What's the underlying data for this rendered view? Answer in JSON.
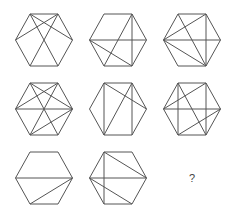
{
  "puzzle": {
    "stroke_color": "#555555",
    "grid": {
      "cols": 3,
      "rows": 3,
      "col_x": [
        44,
        118,
        192
      ],
      "row_y": [
        40,
        109,
        178
      ],
      "half_width": 28.5,
      "half_side": 14,
      "half_height": 26
    },
    "vertex_order": [
      "TL",
      "TR",
      "R",
      "BR",
      "BL",
      "L"
    ],
    "cells": [
      {
        "index": 1,
        "row": 0,
        "col": 0,
        "diagonals": [
          [
            "TL",
            "R"
          ],
          [
            "TR",
            "L"
          ],
          [
            "TL",
            "BR"
          ],
          [
            "TR",
            "BL"
          ]
        ]
      },
      {
        "index": 2,
        "row": 0,
        "col": 1,
        "diagonals": [
          [
            "TR",
            "BR"
          ],
          [
            "L",
            "R"
          ],
          [
            "TR",
            "BL"
          ],
          [
            "L",
            "BR"
          ]
        ]
      },
      {
        "index": 3,
        "row": 0,
        "col": 2,
        "diagonals": [
          [
            "TL",
            "BR"
          ],
          [
            "TR",
            "L"
          ],
          [
            "TR",
            "BR"
          ],
          [
            "L",
            "R"
          ],
          [
            "L",
            "BR"
          ]
        ]
      },
      {
        "index": 4,
        "row": 1,
        "col": 0,
        "diagonals": [
          [
            "TL",
            "R"
          ],
          [
            "TR",
            "L"
          ],
          [
            "L",
            "R"
          ],
          [
            "TL",
            "BR"
          ],
          [
            "TR",
            "BL"
          ],
          [
            "BL",
            "R"
          ]
        ]
      },
      {
        "index": 5,
        "row": 1,
        "col": 1,
        "diagonals": [
          [
            "TL",
            "BL"
          ],
          [
            "TR",
            "BR"
          ],
          [
            "TL",
            "R"
          ],
          [
            "TR",
            "BL"
          ]
        ]
      },
      {
        "index": 6,
        "row": 1,
        "col": 2,
        "diagonals": [
          [
            "TL",
            "BL"
          ],
          [
            "TR",
            "BR"
          ],
          [
            "TR",
            "L"
          ],
          [
            "L",
            "R"
          ],
          [
            "TL",
            "BR"
          ],
          [
            "BL",
            "R"
          ]
        ]
      },
      {
        "index": 7,
        "row": 2,
        "col": 0,
        "diagonals": [
          [
            "L",
            "R"
          ],
          [
            "BL",
            "R"
          ]
        ]
      },
      {
        "index": 8,
        "row": 2,
        "col": 1,
        "diagonals": [
          [
            "TL",
            "BL"
          ],
          [
            "TL",
            "R"
          ],
          [
            "L",
            "R"
          ],
          [
            "L",
            "BR"
          ]
        ]
      }
    ],
    "missing": {
      "index": 9,
      "row": 2,
      "col": 2,
      "label": "?"
    }
  }
}
